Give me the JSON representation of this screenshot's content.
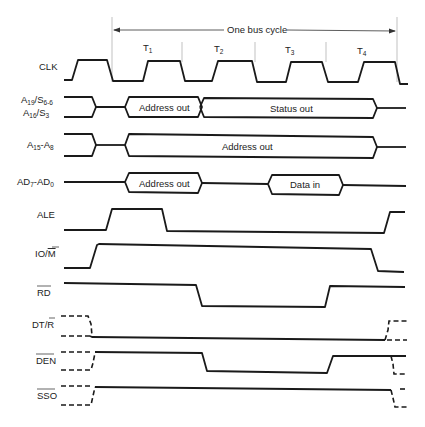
{
  "bus_cycle": {
    "label": "One bus cycle",
    "states": [
      "T1",
      "T2",
      "T3",
      "T4"
    ]
  },
  "signals": [
    {
      "id": "clk",
      "label": "CLK"
    },
    {
      "id": "a19",
      "label_line1": "A19/S6-6",
      "label_line2": "A16/S3",
      "segments": [
        "Address out",
        "Status out"
      ]
    },
    {
      "id": "a15",
      "label": "A15-A8",
      "segments": [
        "Address out"
      ]
    },
    {
      "id": "ad",
      "label": "AD7-AD0",
      "segments": [
        "Address out",
        "Data in"
      ]
    },
    {
      "id": "ale",
      "label": "ALE"
    },
    {
      "id": "iom",
      "label": "IO/M"
    },
    {
      "id": "rd",
      "label": "RD"
    },
    {
      "id": "dtr",
      "label": "DT/R"
    },
    {
      "id": "den",
      "label": "DEN"
    },
    {
      "id": "sso",
      "label": "SSO"
    }
  ],
  "text": {
    "bus_cycle": "One bus cycle",
    "t1": "T",
    "t2": "T",
    "t3": "T",
    "t4": "T",
    "t1_sub": "1",
    "t2_sub": "2",
    "t3_sub": "3",
    "t4_sub": "4",
    "clk": "CLK",
    "a19_a": "A",
    "a19_a_sub": "19",
    "a19_s": "/S",
    "a19_s_sub": "6-6",
    "a16_a": "A",
    "a16_a_sub": "16",
    "a16_s": "/S",
    "a16_s_sub": "3",
    "a15_a": "A",
    "a15_a_sub": "15",
    "a15_dash": "-A",
    "a15_b_sub": "8",
    "ad_a": "AD",
    "ad_a_sub": "7",
    "ad_dash": "-AD",
    "ad_b_sub": "0",
    "ale": "ALE",
    "iom_io": "IO/",
    "iom_m": "M",
    "rd": "RD",
    "dtr_dt": "DT/",
    "dtr_r": "R",
    "den": "DEN",
    "sso": "SSO",
    "a19_seg1": "Address out",
    "a19_seg2": "Status out",
    "a15_seg1": "Address out",
    "ad_seg1": "Address out",
    "ad_seg2": "Data in"
  }
}
